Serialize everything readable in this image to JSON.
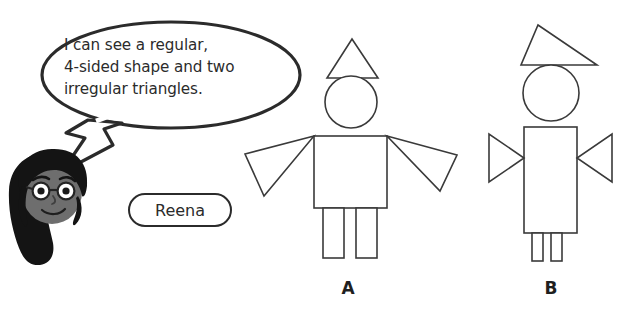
{
  "scene": {
    "background_color": "#ffffff",
    "stroke_color": "#3a3a3a",
    "ink_color": "#2b2b2b",
    "width": 626,
    "height": 314
  },
  "speech_bubble": {
    "speaker": "Reena",
    "lines": [
      "I can see a regular,",
      "4-sided shape and two",
      "irregular triangles."
    ],
    "full_text": "I can see a regular, 4-sided shape and two irregular triangles."
  },
  "name_tag": {
    "label": "Reena"
  },
  "avatar": {
    "description": "girl-with-glasses",
    "hair_color": "#1a1a1a",
    "skin_color": "#6b6b6b"
  },
  "figures": [
    {
      "label": "A",
      "parts": {
        "hat": "equilateral-triangle",
        "head": "circle",
        "body": "square",
        "arms": "two irregular triangles pointing down and outward",
        "legs": "two rectangles"
      }
    },
    {
      "label": "B",
      "parts": {
        "hat": "scalene-triangle",
        "head": "circle",
        "body": "rectangle",
        "arms": "two triangles pointing inward",
        "legs": "two narrow rectangles"
      }
    }
  ]
}
